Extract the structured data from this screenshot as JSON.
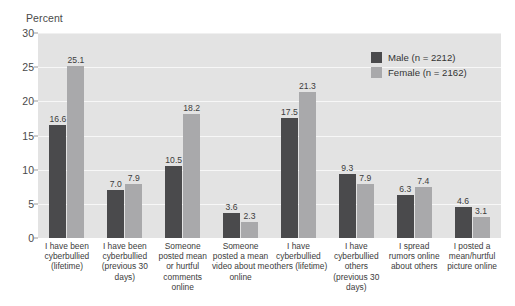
{
  "chart_data": {
    "type": "bar",
    "title": "",
    "xlabel": "",
    "ylabel": "Percent",
    "ylim": [
      0,
      30
    ],
    "yticks": [
      "0",
      "5",
      "10",
      "15",
      "20",
      "25",
      "30"
    ],
    "grid": true,
    "legend_position": "top-right",
    "categories": [
      "I have been cyberbullied (lifetime)",
      "I have been cyberbullied (previous 30 days)",
      "Someone posted mean or hurtful comments online",
      "Someone posted a mean video about me online",
      "I have cyberbullied others (lifetime)",
      "I have cyberbullied others (previous 30 days)",
      "I spread rumors online about others",
      "I posted a mean/hurtful picture online"
    ],
    "series": [
      {
        "name": "Male (n = 2212)",
        "color": "#4a4a4c",
        "values": [
          16.6,
          7.0,
          10.5,
          3.6,
          17.5,
          9.3,
          6.3,
          4.6
        ],
        "labels": [
          "16.6",
          "7.0",
          "10.5",
          "3.6",
          "17.5",
          "9.3",
          "6.3",
          "4.6"
        ]
      },
      {
        "name": "Female (n = 2162)",
        "color": "#a9a9ab",
        "values": [
          25.1,
          7.9,
          18.2,
          2.3,
          21.3,
          7.9,
          7.4,
          3.1
        ],
        "labels": [
          "25.1",
          "7.9",
          "18.2",
          "2.3",
          "21.3",
          "7.9",
          "7.4",
          "3.1"
        ]
      }
    ]
  },
  "legend": {
    "items": [
      {
        "label": "Male (n = 2212)",
        "color": "#4a4a4c"
      },
      {
        "label": "Female (n = 2162)",
        "color": "#a9a9ab"
      }
    ]
  },
  "axis": {
    "y_title": "Percent"
  },
  "colors": {
    "male": "#4a4a4c",
    "female": "#a9a9ab",
    "plot_background": "#e3e3e3",
    "gridline": "#f7f7f7"
  }
}
